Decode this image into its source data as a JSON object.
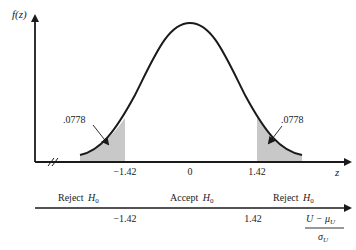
{
  "diagram": {
    "y_axis_label": "f(z)",
    "x_axis_label": "z",
    "tail_area_left": ".0778",
    "tail_area_right": ".0778",
    "ticks": [
      {
        "label": "−1.42",
        "value": -1.42
      },
      {
        "label": "0",
        "value": 0
      },
      {
        "label": "1.42",
        "value": 1.42
      }
    ],
    "shade_color": "#c8c8c8",
    "line_color": "#1a1a1a"
  },
  "decision_line": {
    "regions": [
      {
        "label": "Reject",
        "sub": "H",
        "subscript": "0"
      },
      {
        "label": "Accept",
        "sub": "H",
        "subscript": "0"
      },
      {
        "label": "Reject",
        "sub": "H",
        "subscript": "0"
      }
    ],
    "critical_values": [
      "−1.42",
      "1.42"
    ],
    "statistic_numerator": "U − μ",
    "statistic_numerator_sub": "U",
    "statistic_denominator": "σ",
    "statistic_denominator_sub": "U"
  }
}
